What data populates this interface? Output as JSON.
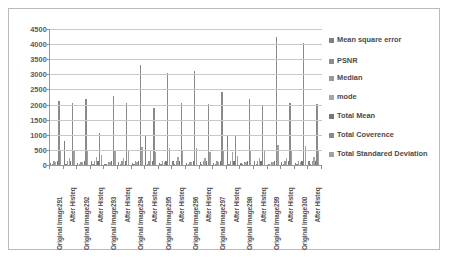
{
  "chart_data": {
    "type": "bar",
    "title": "",
    "xlabel": "",
    "ylabel": "",
    "ylim": [
      0,
      4500
    ],
    "ytick_step": 500,
    "yticks": [
      "4500",
      "4000",
      "3500",
      "3000",
      "2500",
      "2000",
      "1500",
      "1000",
      "500",
      "0"
    ],
    "grid": true,
    "legend_position": "right",
    "categories": [
      "Original Image291",
      "After Histeq",
      "Original Image292",
      "After Histeq",
      "Original Image293",
      "After Histeq",
      "Original Image294",
      "After Histeq",
      "Original Image295",
      "After Histeq",
      "Original Image296",
      "After Histeq",
      "Original Image297",
      "After Histeq",
      "Original Image298",
      "After Histeq",
      "Original Image299",
      "After Histeq",
      "Original Image300",
      "After Histeq"
    ],
    "series": [
      {
        "name": "Mean square error",
        "color": "#7f7f7f",
        "values": [
          60,
          780,
          55,
          120,
          50,
          90,
          55,
          1000,
          60,
          140,
          55,
          110,
          60,
          950,
          55,
          120,
          50,
          100,
          55,
          130
        ]
      },
      {
        "name": "PSNR",
        "color": "#8c8c8c",
        "values": [
          35,
          40,
          35,
          38,
          35,
          36,
          35,
          42,
          35,
          38,
          35,
          37,
          35,
          41,
          35,
          38,
          35,
          36,
          35,
          39
        ]
      },
      {
        "name": "Median",
        "color": "#999999",
        "values": [
          120,
          130,
          115,
          128,
          110,
          125,
          118,
          132,
          122,
          130,
          116,
          127,
          120,
          131,
          114,
          126,
          112,
          124,
          119,
          129
        ]
      },
      {
        "name": "mode",
        "color": "#a6a6a6",
        "values": [
          95,
          240,
          100,
          255,
          90,
          230,
          105,
          470,
          98,
          250,
          92,
          245,
          100,
          430,
          96,
          248,
          88,
          235,
          102,
          252
        ]
      },
      {
        "name": "Total Mean",
        "color": "#767676",
        "values": [
          125,
          128,
          122,
          127,
          118,
          126,
          124,
          130,
          126,
          129,
          120,
          127,
          123,
          130,
          121,
          128,
          117,
          125,
          124,
          129
        ]
      },
      {
        "name": "Total Coverence",
        "color": "#8a8a8a",
        "values": [
          2120,
          2050,
          2200,
          1050,
          2280,
          2050,
          3320,
          1900,
          3050,
          2060,
          3120,
          2010,
          2430,
          1000,
          2200,
          2000,
          4250,
          2060,
          4050,
          2030
        ]
      },
      {
        "name": "Total Standared Deviation",
        "color": "#a0a0a0",
        "values": [
          460,
          450,
          470,
          320,
          480,
          450,
          580,
          430,
          550,
          455,
          560,
          445,
          495,
          310,
          470,
          450,
          650,
          455,
          640,
          450
        ]
      }
    ]
  },
  "legend": {
    "items": [
      {
        "label": "Mean square error"
      },
      {
        "label": "PSNR"
      },
      {
        "label": "Median"
      },
      {
        "label": "mode"
      },
      {
        "label": "Total Mean"
      },
      {
        "label": "Total Coverence"
      },
      {
        "label": "Total Standared Deviation"
      }
    ]
  },
  "caption": ""
}
